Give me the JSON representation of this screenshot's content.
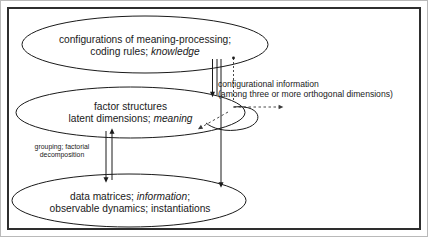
{
  "figure": {
    "kind": "layered-ellipse-diagram",
    "background_color": "#ffffff",
    "border_color": "#2e2e2e",
    "stroke_color": "#1a1a1a"
  },
  "levels": {
    "top": {
      "line1": "configurations of meaning-processing;",
      "line2_plain": "coding rules; ",
      "line2_italic": "knowledge"
    },
    "middle": {
      "line1": "factor structures",
      "line2_plain": "latent dimensions; ",
      "line2_italic": "meaning"
    },
    "bottom": {
      "line1_plain_a": "data matrices; ",
      "line1_italic": "information",
      "line1_plain_b": ";",
      "line2": "observable dynamics; instantiations"
    }
  },
  "annotations": {
    "configurational": {
      "line1": "configurational information",
      "line2": "(among three or more orthogonal dimensions)"
    },
    "grouping": {
      "line1": "grouping; factorial",
      "line2": "decomposition"
    }
  }
}
